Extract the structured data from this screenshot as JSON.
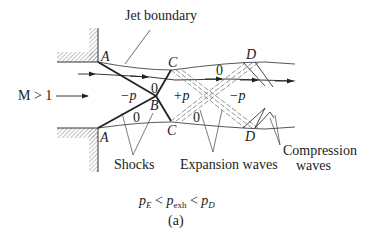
{
  "labels": {
    "jet_boundary": "Jet boundary",
    "mach": "M > 1",
    "shocks": "Shocks",
    "expansion_waves": "Expansion waves",
    "compression_line1": "Compression",
    "compression_line2": "waves",
    "caption_tag": "(a)"
  },
  "points": {
    "A_upper": "A",
    "A_lower": "A",
    "B": "B",
    "C_upper": "C",
    "C_lower": "C",
    "D_upper": "D",
    "D_lower": "D"
  },
  "regions": {
    "minus_p_left": "−p",
    "plus_p": "+p",
    "minus_p_right": "−p",
    "zero_upper_B": "0",
    "zero_lower_B": "0",
    "zero_lower_C": "0",
    "zero_upper_C": "0"
  },
  "condition": {
    "p1": "p",
    "p1_sub": "E",
    "lt1": " < ",
    "p2": "p",
    "p2_sub": "exh",
    "lt2": " < ",
    "p3": "p",
    "p3_sub": "D"
  },
  "colors": {
    "line": "#222222",
    "thin_line": "#444444",
    "dashed": "#777777",
    "hatch": "#888888"
  }
}
